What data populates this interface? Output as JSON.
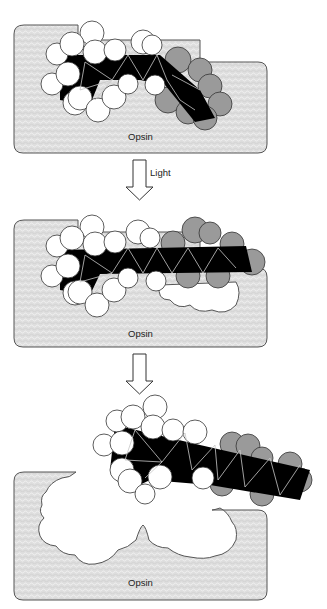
{
  "figure": {
    "colors": {
      "opsin_fill": "#dcdcdc",
      "opsin_outline": "#555555",
      "atom_white": "#ffffff",
      "atom_gray": "#9a9a9a",
      "bond_black": "#000000",
      "bond_line": "#bdbdbd"
    },
    "panels": [
      {
        "id": "bound-11-cis",
        "protein_label": "Opsin"
      },
      {
        "id": "isomerized-all-trans",
        "protein_label": "Opsin"
      },
      {
        "id": "released",
        "protein_label": "Opsin"
      }
    ],
    "arrows": [
      {
        "label": "Light"
      },
      {
        "label": ""
      }
    ]
  }
}
